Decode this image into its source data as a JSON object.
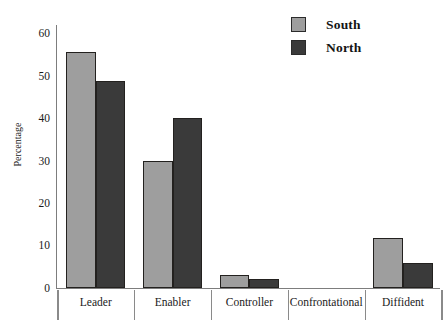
{
  "chart_data": {
    "type": "bar",
    "title": "",
    "xlabel": "",
    "ylabel": "Percentage",
    "ylim": [
      0,
      62
    ],
    "yticks": [
      0,
      10,
      20,
      30,
      40,
      50,
      60
    ],
    "grid": false,
    "legend_position": "top-right",
    "categories": [
      "Leader",
      "Enabler",
      "Controller",
      "Confrontational",
      "Diffident"
    ],
    "series": [
      {
        "name": "South",
        "color": "#9e9e9e",
        "values": [
          55.7,
          29.8,
          3.0,
          0,
          11.8
        ]
      },
      {
        "name": "North",
        "color": "#3a3a3a",
        "values": [
          48.7,
          40.0,
          2.0,
          0,
          5.8
        ]
      }
    ]
  },
  "legend": {
    "items": [
      {
        "label": "South"
      },
      {
        "label": "North"
      }
    ]
  }
}
